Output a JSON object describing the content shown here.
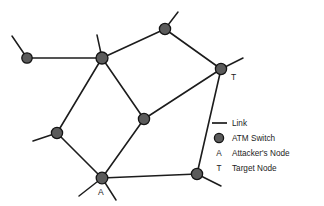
{
  "figure": {
    "type": "network-topology-diagram",
    "background_color": "#ffffff",
    "line_color": "#1c1c1c",
    "node_fill_color": "#5b5b5b",
    "node_stroke_color": "#141414"
  },
  "legend": {
    "items": [
      {
        "symbol_kind": "line",
        "symbol_text": "",
        "label": "Link"
      },
      {
        "symbol_kind": "circle",
        "symbol_text": "",
        "label": "ATM Switch"
      },
      {
        "symbol_kind": "letter",
        "symbol_text": "A",
        "label": "Attacker's Node"
      },
      {
        "symbol_kind": "letter",
        "symbol_text": "T",
        "label": "Target Node"
      }
    ]
  },
  "graph": {
    "nodes": [
      {
        "id": "n1",
        "name": "left-node",
        "x": 27,
        "y": 58,
        "r": 5.2,
        "label": ""
      },
      {
        "id": "n2",
        "name": "hub-node",
        "x": 102,
        "y": 58,
        "r": 6.0,
        "label": ""
      },
      {
        "id": "n3",
        "name": "top-node",
        "x": 165,
        "y": 29,
        "r": 5.6,
        "label": ""
      },
      {
        "id": "n4",
        "name": "target-node",
        "x": 221,
        "y": 69,
        "r": 5.6,
        "label": "T"
      },
      {
        "id": "n5",
        "name": "center-node",
        "x": 144,
        "y": 119,
        "r": 5.6,
        "label": ""
      },
      {
        "id": "n6",
        "name": "left-mid-node",
        "x": 57,
        "y": 133,
        "r": 5.6,
        "label": ""
      },
      {
        "id": "n7",
        "name": "attacker-node",
        "x": 102,
        "y": 178,
        "r": 5.8,
        "label": "A"
      },
      {
        "id": "n8",
        "name": "bottom-right-node",
        "x": 197,
        "y": 174,
        "r": 5.6,
        "label": ""
      }
    ],
    "node_labels": [
      {
        "text": "T",
        "x": 231,
        "y": 80
      },
      {
        "text": "A",
        "x": 98,
        "y": 195
      }
    ],
    "links": [
      {
        "from": "n1",
        "to": "n2"
      },
      {
        "from": "n2",
        "to": "n3"
      },
      {
        "from": "n3",
        "to": "n4"
      },
      {
        "from": "n2",
        "to": "n5"
      },
      {
        "from": "n2",
        "to": "n6"
      },
      {
        "from": "n5",
        "to": "n4"
      },
      {
        "from": "n5",
        "to": "n7"
      },
      {
        "from": "n6",
        "to": "n7"
      },
      {
        "from": "n7",
        "to": "n8"
      },
      {
        "from": "n4",
        "to": "n8"
      }
    ],
    "stubs": [
      {
        "at": "n1",
        "x1": 27,
        "y1": 58,
        "x2": 12,
        "y2": 36
      },
      {
        "at": "n2",
        "x1": 102,
        "y1": 58,
        "x2": 97,
        "y2": 35
      },
      {
        "at": "n3",
        "x1": 165,
        "y1": 29,
        "x2": 178,
        "y2": 12
      },
      {
        "at": "n4",
        "x1": 221,
        "y1": 69,
        "x2": 243,
        "y2": 58
      },
      {
        "at": "n6",
        "x1": 57,
        "y1": 133,
        "x2": 33,
        "y2": 141
      },
      {
        "at": "n7",
        "x1": 102,
        "y1": 178,
        "x2": 79,
        "y2": 196
      },
      {
        "at": "n7",
        "x1": 102,
        "y1": 178,
        "x2": 116,
        "y2": 200
      },
      {
        "at": "n8",
        "x1": 197,
        "y1": 174,
        "x2": 221,
        "y2": 186
      }
    ]
  }
}
